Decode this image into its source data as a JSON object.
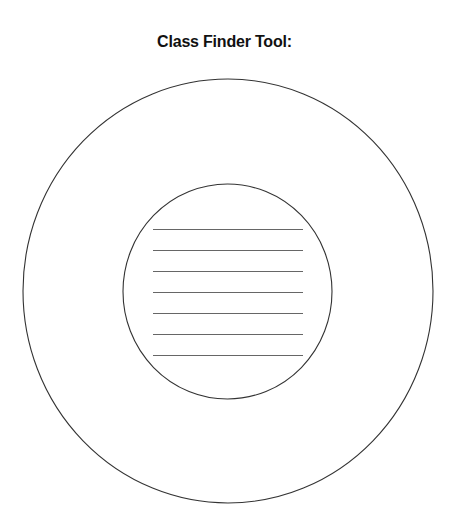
{
  "page": {
    "title": "Class Finder Tool:"
  },
  "diagram": {
    "outer_circle": {
      "cx": 228,
      "cy": 291,
      "rx": 205,
      "ry": 212,
      "stroke": "#333333"
    },
    "inner_circle": {
      "cx": 227.5,
      "cy": 291.5,
      "rx": 104.5,
      "ry": 107.5,
      "stroke": "#333333"
    },
    "writing_lines": {
      "count": 7,
      "x1": 153,
      "x2": 303,
      "y_positions": [
        229,
        250,
        271,
        292,
        313,
        334,
        355
      ],
      "stroke": "#666666"
    }
  }
}
